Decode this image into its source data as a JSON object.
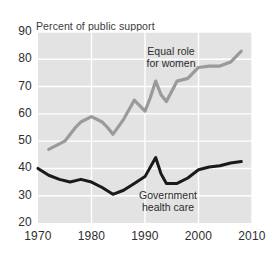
{
  "chart_data": {
    "type": "line",
    "title": "Percent of public support",
    "xlabel": "",
    "ylabel": "",
    "xlim": [
      1970,
      2010
    ],
    "ylim": [
      20,
      90
    ],
    "yticks": [
      20,
      30,
      40,
      50,
      60,
      70,
      80,
      90
    ],
    "xticks": [
      1970,
      1980,
      1990,
      2000,
      2010
    ],
    "grid": true,
    "legend_position": "inline-annotations",
    "plot_background": "#e3e3e3",
    "gridline_color": "#ffffff",
    "series": [
      {
        "name": "Equal role for women",
        "color": "#9a9a9a",
        "label_text": "Equal role\nfor women",
        "x": [
          1972,
          1974,
          1975,
          1977,
          1978,
          1980,
          1982,
          1983,
          1984,
          1986,
          1988,
          1989,
          1990,
          1991,
          1992,
          1993,
          1994,
          1996,
          1998,
          2000,
          2002,
          2004,
          2006,
          2008
        ],
        "values": [
          47,
          49,
          50,
          55,
          57,
          59,
          57,
          55,
          52.5,
          58,
          65,
          63,
          61,
          66,
          72,
          67,
          64.5,
          72,
          73,
          77,
          77.5,
          77.5,
          79,
          83
        ]
      },
      {
        "name": "Government health care",
        "color": "#1a1a1a",
        "label_text": "Government\nhealth care",
        "x": [
          1970,
          1972,
          1974,
          1976,
          1978,
          1980,
          1982,
          1984,
          1986,
          1988,
          1990,
          1992,
          1993,
          1994,
          1996,
          1998,
          2000,
          2002,
          2004,
          2006,
          2008
        ],
        "values": [
          40,
          37.5,
          36,
          35,
          36,
          35,
          33,
          30.5,
          32,
          34.5,
          37,
          44,
          38,
          34.5,
          34.5,
          36.5,
          39.5,
          40.5,
          41,
          42,
          42.5
        ]
      }
    ]
  }
}
